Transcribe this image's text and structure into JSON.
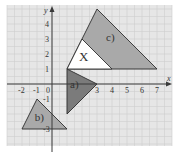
{
  "figure": {
    "background_color": "#e6e6e6",
    "grid_color": "#cfcfcf",
    "axis_color": "#3a3a3a",
    "plot_area_px": {
      "x": 7,
      "y": 5,
      "width": 165,
      "height": 141
    },
    "origin_px": {
      "x": 52,
      "y": 84
    },
    "unit_px": 15
  },
  "axes": {
    "x_label": "x",
    "y_label": "y",
    "x_ticks": [
      {
        "value": -2,
        "label": "-2"
      },
      {
        "value": -1,
        "label": "-1"
      },
      {
        "value": 3,
        "label": "3"
      },
      {
        "value": 4,
        "label": "4"
      },
      {
        "value": 5,
        "label": "5"
      },
      {
        "value": 6,
        "label": "6"
      },
      {
        "value": 7,
        "label": "7"
      }
    ],
    "origin_label": "0",
    "y_ticks": [
      {
        "value": 4,
        "label": "4"
      },
      {
        "value": 3,
        "label": "3"
      },
      {
        "value": 2,
        "label": "2"
      },
      {
        "value": 1,
        "label": "1"
      },
      {
        "value": -1,
        "label": "-1"
      },
      {
        "value": -3,
        "label": "-3"
      }
    ]
  },
  "shapes": [
    {
      "id": "c",
      "label": "c)",
      "fill": "#a9a9a9",
      "vertices": [
        [
          1,
          1
        ],
        [
          3,
          5
        ],
        [
          7,
          1
        ]
      ],
      "label_pos": [
        3.6,
        2.9
      ]
    },
    {
      "id": "x",
      "label": "X",
      "fill": "#ffffff",
      "vertices": [
        [
          1,
          1
        ],
        [
          2,
          3
        ],
        [
          4,
          1
        ]
      ],
      "label_pos": [
        1.8,
        1.55
      ]
    },
    {
      "id": "a",
      "label": "a)",
      "fill": "#7b7b7b",
      "vertices": [
        [
          1,
          1
        ],
        [
          3,
          0
        ],
        [
          1,
          -2
        ]
      ],
      "label_pos": [
        1.2,
        -0.25
      ]
    },
    {
      "id": "b",
      "label": "b)",
      "fill": "#a9a9a9",
      "vertices": [
        [
          -1,
          -1
        ],
        [
          -2,
          -3
        ],
        [
          1,
          -3
        ]
      ],
      "label_pos": [
        -1.15,
        -2.45
      ]
    }
  ]
}
